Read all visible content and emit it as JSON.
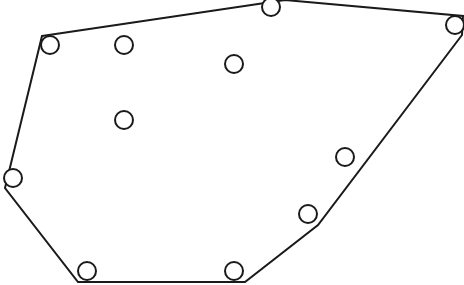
{
  "diagram": {
    "type": "convex-hull",
    "canvas": {
      "width": 464,
      "height": 285
    },
    "stroke_color": "#1a1a1a",
    "background": "#ffffff",
    "hull_polygon": [
      [
        42,
        36
      ],
      [
        285,
        0
      ],
      [
        463,
        16
      ],
      [
        462,
        35
      ],
      [
        318,
        225
      ],
      [
        245,
        282
      ],
      [
        78,
        282
      ],
      [
        5,
        188
      ]
    ],
    "points": [
      {
        "cx": 50,
        "cy": 45,
        "r": 9,
        "on_hull": true
      },
      {
        "cx": 271,
        "cy": 7,
        "r": 9,
        "on_hull": true
      },
      {
        "cx": 455,
        "cy": 25,
        "r": 9,
        "on_hull": true
      },
      {
        "cx": 345,
        "cy": 157,
        "r": 9,
        "on_hull": false
      },
      {
        "cx": 308,
        "cy": 214,
        "r": 9,
        "on_hull": true
      },
      {
        "cx": 234,
        "cy": 271,
        "r": 9,
        "on_hull": true
      },
      {
        "cx": 87,
        "cy": 271,
        "r": 9,
        "on_hull": true
      },
      {
        "cx": 13,
        "cy": 178,
        "r": 9,
        "on_hull": true
      },
      {
        "cx": 124,
        "cy": 45,
        "r": 9,
        "on_hull": false
      },
      {
        "cx": 234,
        "cy": 64,
        "r": 9,
        "on_hull": false
      },
      {
        "cx": 124,
        "cy": 120,
        "r": 9,
        "on_hull": false
      }
    ]
  }
}
